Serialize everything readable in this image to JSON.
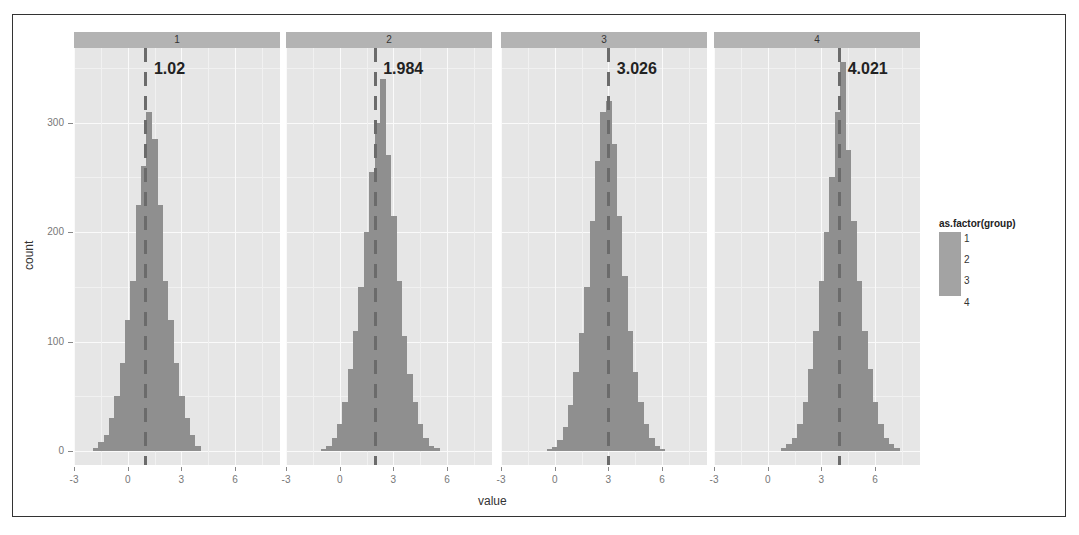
{
  "chart_data": {
    "type": "bar",
    "subtype": "faceted histogram",
    "title": "",
    "xlabel": "value",
    "ylabel": "count",
    "ylim": [
      0,
      370
    ],
    "xlim": [
      -3,
      8.5
    ],
    "x_ticks": [
      "-3",
      "0",
      "3",
      "6"
    ],
    "y_ticks": [
      "0",
      "100",
      "200",
      "300"
    ],
    "grid": true,
    "legend": {
      "title": "as.factor(group)",
      "position": "right",
      "entries": [
        "1",
        "2",
        "3",
        "4"
      ]
    },
    "facets": [
      {
        "label": "1",
        "mean": 1.02,
        "mean_label": "1.02",
        "bin_centers": [
          -1.8,
          -1.5,
          -1.2,
          -0.9,
          -0.6,
          -0.3,
          0.0,
          0.3,
          0.6,
          0.9,
          1.2,
          1.5,
          1.8,
          2.1,
          2.4,
          2.7,
          3.0,
          3.3,
          3.6,
          3.9
        ],
        "counts": [
          3,
          8,
          15,
          30,
          50,
          80,
          120,
          155,
          225,
          260,
          310,
          285,
          225,
          155,
          120,
          80,
          50,
          30,
          15,
          5
        ]
      },
      {
        "label": "2",
        "mean": 1.984,
        "mean_label": "1.984",
        "bin_centers": [
          -0.9,
          -0.6,
          -0.3,
          0.0,
          0.3,
          0.6,
          0.9,
          1.2,
          1.5,
          1.8,
          2.1,
          2.4,
          2.7,
          3.0,
          3.3,
          3.6,
          3.9,
          4.2,
          4.5,
          4.8,
          5.1,
          5.4
        ],
        "counts": [
          2,
          5,
          12,
          25,
          45,
          75,
          110,
          150,
          200,
          255,
          300,
          340,
          270,
          215,
          155,
          105,
          70,
          45,
          25,
          12,
          5,
          3
        ]
      },
      {
        "label": "3",
        "mean": 3.026,
        "mean_label": "3.026",
        "bin_centers": [
          -0.3,
          0.0,
          0.3,
          0.6,
          0.9,
          1.2,
          1.5,
          1.8,
          2.1,
          2.4,
          2.7,
          3.0,
          3.3,
          3.6,
          3.9,
          4.2,
          4.5,
          4.8,
          5.1,
          5.4,
          5.7,
          6.0
        ],
        "counts": [
          2,
          4,
          10,
          22,
          42,
          72,
          108,
          150,
          210,
          265,
          310,
          320,
          280,
          215,
          160,
          110,
          72,
          45,
          25,
          12,
          5,
          2
        ]
      },
      {
        "label": "4",
        "mean": 4.021,
        "mean_label": "4.021",
        "bin_centers": [
          0.9,
          1.2,
          1.5,
          1.8,
          2.1,
          2.4,
          2.7,
          3.0,
          3.3,
          3.6,
          3.9,
          4.2,
          4.5,
          4.8,
          5.1,
          5.4,
          5.7,
          6.0,
          6.3,
          6.6,
          6.9,
          7.2
        ],
        "counts": [
          3,
          6,
          12,
          25,
          45,
          75,
          110,
          155,
          200,
          250,
          310,
          355,
          275,
          210,
          155,
          110,
          75,
          45,
          25,
          12,
          6,
          3
        ]
      }
    ]
  },
  "axis": {
    "y_label": "count",
    "x_label": "value",
    "y_ticks": [
      "0",
      "100",
      "200",
      "300"
    ],
    "x_ticks": [
      "-3",
      "0",
      "3",
      "6"
    ]
  },
  "legend": {
    "title": "as.factor(group)",
    "items": [
      "1",
      "2",
      "3",
      "4"
    ]
  },
  "colors": {
    "panel_bg": "#e6e6e6",
    "strip_bg": "#b3b3b3",
    "bar_fill": "#8f8f8f",
    "mean_line": "#6b6b6b"
  }
}
